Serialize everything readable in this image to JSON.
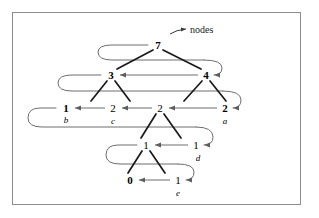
{
  "figure": {
    "background_color": "#ffffff",
    "frame_color": "#8c8c8c",
    "tree_edge_color": "#1a1a1a",
    "thread_arrow_color": "#6e6e6e"
  },
  "annotations": [
    {
      "id": "nodes-annotation",
      "text": "nodes",
      "x": 190,
      "y": 30
    }
  ],
  "levels": [
    {
      "index": 0,
      "y": 45,
      "nodes": [
        {
          "id": "n7",
          "value": "7",
          "name": "",
          "x": 158,
          "y": 45,
          "bold": true
        }
      ]
    },
    {
      "index": 1,
      "y": 75,
      "nodes": [
        {
          "id": "n3",
          "value": "3",
          "name": "",
          "x": 111,
          "y": 75,
          "bold": true
        },
        {
          "id": "n4",
          "value": "4",
          "name": "",
          "x": 206,
          "y": 75,
          "bold": true
        }
      ]
    },
    {
      "index": 2,
      "y": 108,
      "nodes": [
        {
          "id": "n1b",
          "value": "1",
          "name": "b",
          "x": 66,
          "y": 108,
          "bold": true
        },
        {
          "id": "n2c",
          "value": "2",
          "name": "c",
          "x": 113,
          "y": 108,
          "bold": false
        },
        {
          "id": "n2mid",
          "value": "2",
          "name": "",
          "x": 160,
          "y": 108,
          "bold": false
        },
        {
          "id": "n2a",
          "value": "2",
          "name": "a",
          "x": 225,
          "y": 108,
          "bold": true
        }
      ]
    },
    {
      "index": 3,
      "y": 145,
      "nodes": [
        {
          "id": "n1left",
          "value": "1",
          "name": "",
          "x": 146,
          "y": 145,
          "bold": false
        },
        {
          "id": "n1d",
          "value": "1",
          "name": "d",
          "x": 196,
          "y": 145,
          "bold": false
        }
      ]
    },
    {
      "index": 4,
      "y": 180,
      "nodes": [
        {
          "id": "n0",
          "value": "0",
          "name": "",
          "x": 130,
          "y": 180,
          "bold": true
        },
        {
          "id": "n1e",
          "value": "1",
          "name": "e",
          "x": 178,
          "y": 180,
          "bold": false
        }
      ]
    }
  ],
  "node_name_labels": [
    {
      "id": "label-b",
      "text": "b",
      "x": 66,
      "y": 116
    },
    {
      "id": "label-c",
      "text": "c",
      "x": 113,
      "y": 117
    },
    {
      "id": "label-a",
      "text": "a",
      "x": 225,
      "y": 117
    },
    {
      "id": "label-d",
      "text": "d",
      "x": 198,
      "y": 154
    },
    {
      "id": "label-e",
      "text": "e",
      "x": 178,
      "y": 189
    }
  ],
  "tree_edges": [
    {
      "id": "e-7-3",
      "from": "n7",
      "to": "n3",
      "x1": 153,
      "y1": 50,
      "x2": 117,
      "y2": 69
    },
    {
      "id": "e-7-4",
      "from": "n7",
      "to": "n4",
      "x1": 163,
      "y1": 50,
      "x2": 201,
      "y2": 69
    },
    {
      "id": "e-3-1b",
      "from": "n3",
      "to": "n1b",
      "x1": 107,
      "y1": 81,
      "x2": 91,
      "y2": 101
    },
    {
      "id": "e-3-2c",
      "from": "n3",
      "to": "n2c",
      "x1": 115,
      "y1": 81,
      "x2": 130,
      "y2": 101
    },
    {
      "id": "e-4-2mid",
      "from": "n4",
      "to": "n2mid",
      "x1": 202,
      "y1": 81,
      "x2": 184,
      "y2": 101
    },
    {
      "id": "e-4-2a",
      "from": "n4",
      "to": "n2a",
      "x1": 210,
      "y1": 81,
      "x2": 226,
      "y2": 101
    },
    {
      "id": "e-2mid-1left",
      "from": "n2mid",
      "to": "n1left",
      "x1": 156,
      "y1": 114,
      "x2": 141,
      "y2": 138
    },
    {
      "id": "e-2mid-1d",
      "from": "n2mid",
      "to": "n1d",
      "x1": 164,
      "y1": 114,
      "x2": 181,
      "y2": 138
    },
    {
      "id": "e-1left-0",
      "from": "n1left",
      "to": "n0",
      "x1": 142,
      "y1": 151,
      "x2": 128,
      "y2": 173
    },
    {
      "id": "e-1left-1e",
      "from": "n1left",
      "to": "n1e",
      "x1": 150,
      "y1": 151,
      "x2": 165,
      "y2": 173
    }
  ],
  "thread_arrows": [
    {
      "id": "t-4-to-3",
      "from": "n4",
      "to": "n3",
      "x1": 198,
      "y1": 75,
      "x2": 120,
      "y2": 75
    },
    {
      "id": "t-2c-to-1b",
      "from": "n2c",
      "to": "n1b",
      "x1": 105,
      "y1": 108,
      "x2": 75,
      "y2": 108
    },
    {
      "id": "t-2mid-to-2c",
      "from": "n2mid",
      "to": "n2c",
      "x1": 152,
      "y1": 108,
      "x2": 122,
      "y2": 108
    },
    {
      "id": "t-2a-to-2mid",
      "from": "n2a",
      "to": "n2mid",
      "x1": 217,
      "y1": 108,
      "x2": 169,
      "y2": 108
    },
    {
      "id": "t-1d-to-1left",
      "from": "n1d",
      "to": "n1left",
      "x1": 188,
      "y1": 145,
      "x2": 155,
      "y2": 145
    },
    {
      "id": "t-1e-to-0",
      "from": "n1e",
      "to": "n0",
      "x1": 170,
      "y1": 180,
      "x2": 139,
      "y2": 180
    }
  ],
  "thread_wraps": [
    {
      "id": "w-7-start",
      "note": "loop entering level 0 from the left",
      "path": "M 148 45 L 112 45 Q 98 45 98 52 Q 98 60 112 60 L 204 60"
    },
    {
      "id": "w-4-entry",
      "note": "loop wrapping from level 0 into 4",
      "path": "M 204 60 Q 222 60 222 68 Q 222 75 214 75"
    },
    {
      "id": "w-3-start",
      "note": "loop entering level 1 from the left",
      "path": "M 101 75 L 72 75 Q 58 75 58 83 Q 58 91 72 91 L 223 91"
    },
    {
      "id": "w-2a-entry",
      "note": "loop wrapping from level 1 into 2a",
      "path": "M 223 91 Q 241 91 241 100 Q 241 108 233 108"
    },
    {
      "id": "w-1b-start",
      "note": "loop entering level 2 from the left",
      "path": "M 56 108 L 40 108 Q 28 108 28 118 Q 28 127 42 127 L 196 127"
    },
    {
      "id": "w-1d-entry",
      "note": "loop wrapping from level 2 into 1d",
      "path": "M 196 127 Q 213 127 213 137 Q 213 145 204 145"
    },
    {
      "id": "w-1left-start",
      "note": "loop entering level 3 from the left",
      "path": "M 137 145 L 118 145 Q 106 145 106 155 Q 106 164 120 164 L 178 164"
    },
    {
      "id": "w-1e-entry",
      "note": "loop wrapping from level 3 into 1e",
      "path": "M 178 164 Q 194 164 194 172 Q 194 180 186 180"
    }
  ]
}
